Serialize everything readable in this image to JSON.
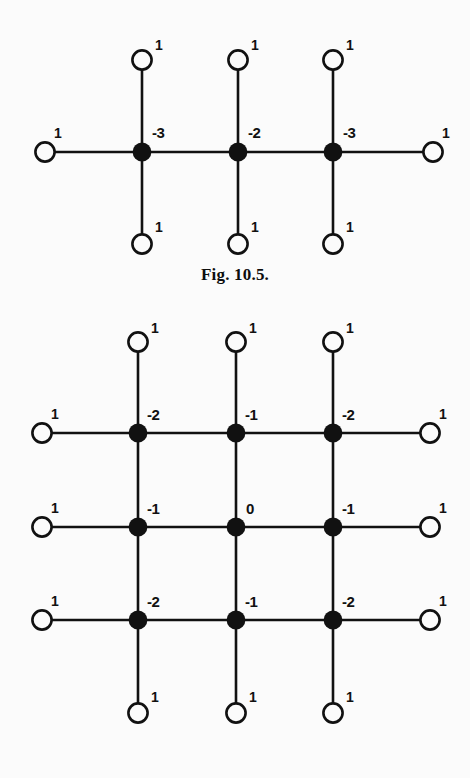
{
  "page": {
    "background_color": "#fbfbfb",
    "ink_color": "#111111",
    "width": 470,
    "height": 778
  },
  "figures": [
    {
      "id": "fig-10-5",
      "caption": "Fig.  10.5.",
      "description": "Path graph of three interior vertices with pendant leaves",
      "interior_labels": [
        "-3",
        "-2",
        "-3"
      ],
      "leaf_label": "1",
      "leaf_count": 8
    },
    {
      "id": "fig-10-6",
      "caption": "Fig.  10.6.",
      "description": "3 by 3 grid graph with pendant leaves on the boundary",
      "interior_labels": [
        [
          "-2",
          "-1",
          "-2"
        ],
        [
          "-1",
          "0",
          "-1"
        ],
        [
          "-2",
          "-1",
          "-2"
        ]
      ],
      "leaf_label": "1",
      "leaf_count": 12
    }
  ],
  "chart_data": {
    "type": "diagram",
    "graphs": [
      {
        "name": "Fig.  10.5.",
        "layout": "path-with-pendants",
        "filled_nodes": [
          {
            "id": "a1",
            "cx": 142,
            "cy": 152,
            "label": "-3",
            "label_dx": 10,
            "label_dy": -14
          },
          {
            "id": "a2",
            "cx": 238,
            "cy": 152,
            "label": "-2",
            "label_dx": 10,
            "label_dy": -14
          },
          {
            "id": "a3",
            "cx": 333,
            "cy": 152,
            "label": "-3",
            "label_dx": 10,
            "label_dy": -14
          }
        ],
        "open_nodes": [
          {
            "id": "l1",
            "cx": 45,
            "cy": 152,
            "label": "1",
            "label_dx": 9,
            "label_dy": -14
          },
          {
            "id": "l2",
            "cx": 433,
            "cy": 152,
            "label": "1",
            "label_dx": 9,
            "label_dy": -14
          },
          {
            "id": "t1",
            "cx": 142,
            "cy": 60,
            "label": "1",
            "label_dx": 13,
            "label_dy": -10
          },
          {
            "id": "t2",
            "cx": 238,
            "cy": 60,
            "label": "1",
            "label_dx": 13,
            "label_dy": -10
          },
          {
            "id": "t3",
            "cx": 333,
            "cy": 60,
            "label": "1",
            "label_dx": 13,
            "label_dy": -10
          },
          {
            "id": "b1",
            "cx": 142,
            "cy": 244,
            "label": "1",
            "label_dx": 13,
            "label_dy": -12
          },
          {
            "id": "b2",
            "cx": 238,
            "cy": 244,
            "label": "1",
            "label_dx": 13,
            "label_dy": -12
          },
          {
            "id": "b3",
            "cx": 333,
            "cy": 244,
            "label": "1",
            "label_dx": 13,
            "label_dy": -12
          }
        ],
        "edges": [
          [
            45,
            152,
            333,
            152
          ],
          [
            333,
            152,
            433,
            152
          ],
          [
            142,
            60,
            142,
            244
          ],
          [
            238,
            60,
            238,
            244
          ],
          [
            333,
            60,
            333,
            244
          ]
        ]
      },
      {
        "name": "Fig.  10.6.",
        "layout": "grid-3x3-with-pendants",
        "filled_nodes": [
          {
            "id": "g11",
            "cx": 138,
            "cy": 133,
            "label": "-2",
            "label_dx": 9,
            "label_dy": -13
          },
          {
            "id": "g12",
            "cx": 236,
            "cy": 133,
            "label": "-1",
            "label_dx": 9,
            "label_dy": -13
          },
          {
            "id": "g13",
            "cx": 333,
            "cy": 133,
            "label": "-2",
            "label_dx": 9,
            "label_dy": -13
          },
          {
            "id": "g21",
            "cx": 138,
            "cy": 227,
            "label": "-1",
            "label_dx": 9,
            "label_dy": -13
          },
          {
            "id": "g22",
            "cx": 236,
            "cy": 227,
            "label": "0",
            "label_dx": 10,
            "label_dy": -13
          },
          {
            "id": "g23",
            "cx": 333,
            "cy": 227,
            "label": "-1",
            "label_dx": 9,
            "label_dy": -13
          },
          {
            "id": "g31",
            "cx": 138,
            "cy": 320,
            "label": "-2",
            "label_dx": 9,
            "label_dy": -13
          },
          {
            "id": "g32",
            "cx": 236,
            "cy": 320,
            "label": "-1",
            "label_dx": 9,
            "label_dy": -13
          },
          {
            "id": "g33",
            "cx": 333,
            "cy": 320,
            "label": "-2",
            "label_dx": 9,
            "label_dy": -13
          }
        ],
        "open_nodes": [
          {
            "id": "n1",
            "cx": 138,
            "cy": 42,
            "label": "1",
            "label_dx": 13,
            "label_dy": -9
          },
          {
            "id": "n2",
            "cx": 236,
            "cy": 42,
            "label": "1",
            "label_dx": 13,
            "label_dy": -9
          },
          {
            "id": "n3",
            "cx": 333,
            "cy": 42,
            "label": "1",
            "label_dx": 13,
            "label_dy": -9
          },
          {
            "id": "w1",
            "cx": 42,
            "cy": 133,
            "label": "1",
            "label_dx": 9,
            "label_dy": -14
          },
          {
            "id": "w2",
            "cx": 42,
            "cy": 227,
            "label": "1",
            "label_dx": 9,
            "label_dy": -14
          },
          {
            "id": "w3",
            "cx": 42,
            "cy": 320,
            "label": "1",
            "label_dx": 9,
            "label_dy": -14
          },
          {
            "id": "e1",
            "cx": 430,
            "cy": 133,
            "label": "1",
            "label_dx": 9,
            "label_dy": -14
          },
          {
            "id": "e2",
            "cx": 430,
            "cy": 227,
            "label": "1",
            "label_dx": 9,
            "label_dy": -14
          },
          {
            "id": "e3",
            "cx": 430,
            "cy": 320,
            "label": "1",
            "label_dx": 9,
            "label_dy": -14
          },
          {
            "id": "s1",
            "cx": 138,
            "cy": 413,
            "label": "1",
            "label_dx": 13,
            "label_dy": -11
          },
          {
            "id": "s2",
            "cx": 236,
            "cy": 413,
            "label": "1",
            "label_dx": 13,
            "label_dy": -11
          },
          {
            "id": "s3",
            "cx": 333,
            "cy": 413,
            "label": "1",
            "label_dx": 13,
            "label_dy": -11
          }
        ],
        "edges": [
          [
            42,
            133,
            430,
            133
          ],
          [
            42,
            227,
            430,
            227
          ],
          [
            42,
            320,
            430,
            320
          ],
          [
            138,
            42,
            138,
            413
          ],
          [
            236,
            42,
            236,
            413
          ],
          [
            333,
            42,
            333,
            413
          ]
        ]
      }
    ]
  }
}
